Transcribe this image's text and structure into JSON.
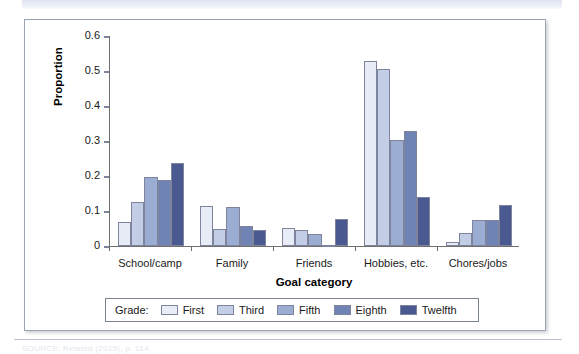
{
  "figure": {
    "y_axis_title": "Proportion",
    "x_axis_title": "Goal category",
    "legend_title": "Grade:",
    "source_caption": "SOURCE: Related (2015), p. 114."
  },
  "chart_data": {
    "type": "bar",
    "title": "",
    "xlabel": "Goal category",
    "ylabel": "Proportion",
    "ylim": [
      0,
      0.6
    ],
    "yticks": [
      0,
      0.1,
      0.2,
      0.3,
      0.4,
      0.5,
      0.6
    ],
    "ytick_labels": [
      "0",
      "0.1",
      "0.2",
      "0.3",
      "0.4",
      "0.5",
      "0.6"
    ],
    "grid": false,
    "legend_position": "bottom",
    "categories": [
      "School/camp",
      "Family",
      "Friends",
      "Hobbies, etc.",
      "Chores/jobs"
    ],
    "series": [
      {
        "name": "First",
        "color": "#e7ecf7",
        "values": [
          0.07,
          0.115,
          0.052,
          0.53,
          0.012
        ]
      },
      {
        "name": "Third",
        "color": "#c3cde5",
        "values": [
          0.127,
          0.05,
          0.045,
          0.505,
          0.037
        ]
      },
      {
        "name": "Fifth",
        "color": "#9badd2",
        "values": [
          0.197,
          0.112,
          0.035,
          0.303,
          0.074
        ]
      },
      {
        "name": "Eighth",
        "color": "#6f83b4",
        "values": [
          0.189,
          0.056,
          0.002,
          0.33,
          0.075
        ]
      },
      {
        "name": "Twelfth",
        "color": "#4a5a90",
        "values": [
          0.237,
          0.045,
          0.077,
          0.141,
          0.117
        ]
      }
    ]
  }
}
